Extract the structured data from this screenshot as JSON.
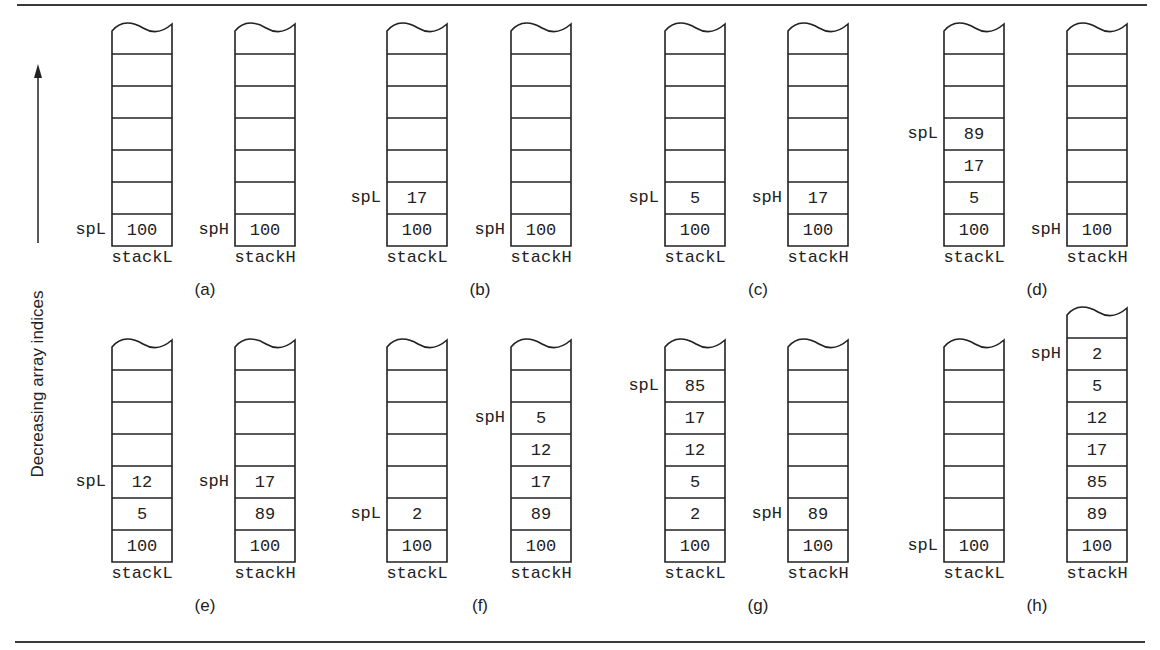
{
  "axis": {
    "label": "Decreasing array indices",
    "direction": "up"
  },
  "colors": {
    "ink": "#222222",
    "rule": "#3a3a3a",
    "background": "#ffffff"
  },
  "panels": [
    {
      "id": "a",
      "label": "(a)",
      "row": 0,
      "stackL": {
        "name": "stackL",
        "pointer": "spL",
        "values": [
          "100"
        ],
        "total_cells": 7
      },
      "stackH": {
        "name": "stackH",
        "pointer": "spH",
        "values": [
          "100"
        ],
        "total_cells": 7
      }
    },
    {
      "id": "b",
      "label": "(b)",
      "row": 0,
      "stackL": {
        "name": "stackL",
        "pointer": "spL",
        "values": [
          "100",
          "17"
        ],
        "total_cells": 7
      },
      "stackH": {
        "name": "stackH",
        "pointer": "spH",
        "values": [
          "100"
        ],
        "total_cells": 7
      }
    },
    {
      "id": "c",
      "label": "(c)",
      "row": 0,
      "stackL": {
        "name": "stackL",
        "pointer": "spL",
        "values": [
          "100",
          "5"
        ],
        "total_cells": 7
      },
      "stackH": {
        "name": "stackH",
        "pointer": "spH",
        "values": [
          "100",
          "17"
        ],
        "total_cells": 7
      }
    },
    {
      "id": "d",
      "label": "(d)",
      "row": 0,
      "stackL": {
        "name": "stackL",
        "pointer": "spL",
        "values": [
          "100",
          "5",
          "17",
          "89"
        ],
        "total_cells": 7
      },
      "stackH": {
        "name": "stackH",
        "pointer": "spH",
        "values": [
          "100"
        ],
        "total_cells": 7
      }
    },
    {
      "id": "e",
      "label": "(e)",
      "row": 1,
      "stackL": {
        "name": "stackL",
        "pointer": "spL",
        "values": [
          "100",
          "5",
          "12"
        ],
        "total_cells": 7
      },
      "stackH": {
        "name": "stackH",
        "pointer": "spH",
        "values": [
          "100",
          "89",
          "17"
        ],
        "total_cells": 7
      }
    },
    {
      "id": "f",
      "label": "(f)",
      "row": 1,
      "stackL": {
        "name": "stackL",
        "pointer": "spL",
        "values": [
          "100",
          "2"
        ],
        "total_cells": 7
      },
      "stackH": {
        "name": "stackH",
        "pointer": "spH",
        "values": [
          "100",
          "89",
          "17",
          "12",
          "5"
        ],
        "total_cells": 7
      }
    },
    {
      "id": "g",
      "label": "(g)",
      "row": 1,
      "stackL": {
        "name": "stackL",
        "pointer": "spL",
        "values": [
          "100",
          "2",
          "5",
          "12",
          "17",
          "85"
        ],
        "total_cells": 7
      },
      "stackH": {
        "name": "stackH",
        "pointer": "spH",
        "values": [
          "100",
          "89"
        ],
        "total_cells": 7
      }
    },
    {
      "id": "h",
      "label": "(h)",
      "row": 1,
      "stackL": {
        "name": "stackL",
        "pointer": "spL",
        "values": [
          "100"
        ],
        "total_cells": 7
      },
      "stackH": {
        "name": "stackH",
        "pointer": "spH",
        "values": [
          "100",
          "89",
          "85",
          "17",
          "12",
          "5",
          "2"
        ],
        "total_cells": 8
      }
    }
  ]
}
